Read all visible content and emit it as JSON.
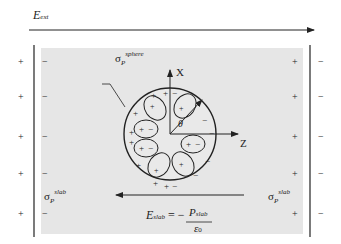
{
  "external_field": {
    "label_main": "E",
    "label_sub": "ext",
    "direction": "right"
  },
  "slab": {
    "fill_color": "#e6e6e6",
    "left_outer_charges": [
      "+",
      "+",
      "+",
      "+",
      "+"
    ],
    "left_inner_charges": [
      "−",
      "−",
      "−",
      "−",
      "−"
    ],
    "right_inner_charges": [
      "+",
      "+",
      "+",
      "+",
      "+"
    ],
    "right_outer_charges": [
      "−",
      "−",
      "−",
      "−",
      "−"
    ],
    "left_label": {
      "main": "σ",
      "sub": "P",
      "sup": "slab"
    },
    "right_label": {
      "main": "σ",
      "sub": "P",
      "sup": "slab"
    }
  },
  "sphere": {
    "label": {
      "main": "σ",
      "sub": "P",
      "sup": "sphere"
    },
    "axis_x_label": "X",
    "axis_z_label": "Z",
    "angle_label": "θ",
    "dipole_signs": [
      "+",
      "−"
    ],
    "surface_plus": "+",
    "surface_minus": "−"
  },
  "slab_field": {
    "label_main": "E",
    "label_sub": "slab",
    "equals": "= −",
    "numerator_main": "P",
    "numerator_sub": "slab",
    "denominator_main": "ε",
    "denominator_sub": "0",
    "direction": "left"
  }
}
